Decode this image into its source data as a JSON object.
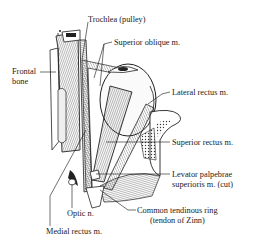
{
  "figure": {
    "labels": {
      "trochlea": "Trochlea (pulley)",
      "superior_oblique": "Superior oblique m.",
      "frontal_bone_1": "Frontal",
      "frontal_bone_2": "bone",
      "lateral_rectus": "Lateral rectus m.",
      "superior_rectus": "Superior rectus m.",
      "levator_1": "Levator palpebrae",
      "levator_2": "superioris m. (cut)",
      "optic_nerve": "Optic n.",
      "common_ring_1": "Common tendinous ring",
      "common_ring_2": "(tendon of Zinn)",
      "medial_rectus": "Medial rectus m."
    },
    "colors": {
      "ink": "#1a1a1a",
      "background": "#ffffff"
    }
  }
}
